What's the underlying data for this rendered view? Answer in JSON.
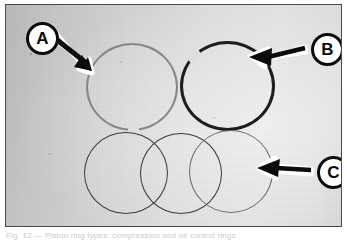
{
  "figure": {
    "type": "photograph",
    "border_color": "#4a4a4a",
    "background_color": "#dcdddA",
    "caption": "Fig. 12 — Piston ring types: compression and oil control rings"
  },
  "callouts": [
    {
      "id": "A",
      "label": "A",
      "target": "thin-light-compression-ring-with-gap-at-bottom",
      "arrow_direction": "down-right",
      "circle_color": "#ffffff",
      "text_color": "#0b0b0b"
    },
    {
      "id": "B",
      "label": "B",
      "target": "thick-dark-compression-ring-with-gap-at-upper-left",
      "arrow_direction": "left",
      "circle_color": "#ffffff",
      "text_color": "#0b0b0b"
    },
    {
      "id": "C",
      "label": "C",
      "target": "three-overlapping-thin-oil-control-rings",
      "arrow_direction": "left",
      "circle_color": "#ffffff",
      "text_color": "#0b0b0b"
    }
  ],
  "rings": [
    {
      "name": "ring-a",
      "style": "thin",
      "color": "#6e6f6c",
      "gap": "bottom"
    },
    {
      "name": "ring-b",
      "style": "thick",
      "color": "#1d1d1d",
      "gap": "upper-left"
    },
    {
      "name": "ring-c1",
      "style": "thin",
      "color": "#3b3b3b",
      "gap": "none"
    },
    {
      "name": "ring-c2",
      "style": "thin",
      "color": "#3a3a3a",
      "gap": "none"
    },
    {
      "name": "ring-c3",
      "style": "thin",
      "color": "#6a6a68",
      "gap": "none"
    }
  ]
}
